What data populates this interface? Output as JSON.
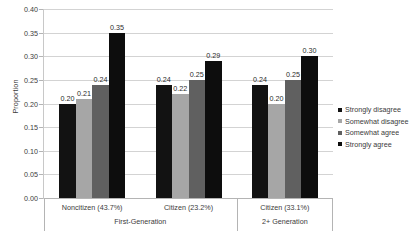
{
  "chart_data": {
    "type": "bar",
    "title": "",
    "xlabel": "",
    "ylabel": "Proportion",
    "ylim": [
      0,
      0.4
    ],
    "ytick_labels": [
      "0.00",
      "0.05",
      "0.10",
      "0.15",
      "0.20",
      "0.25",
      "0.30",
      "0.35",
      "0.40"
    ],
    "ytick_values": [
      0,
      0.05,
      0.1,
      0.15,
      0.2,
      0.25,
      0.3,
      0.35,
      0.4
    ],
    "grid": true,
    "legend_position": "right",
    "categories": [
      "Noncitizen (43.7%)",
      "Citizen (23.2%)",
      "Citizen (33.1%)"
    ],
    "supercategories": [
      {
        "label": "First-Generation",
        "categories": [
          "Noncitizen (43.7%)",
          "Citizen (23.2%)"
        ]
      },
      {
        "label": "2+ Generation",
        "categories": [
          "Citizen (33.1%)"
        ]
      }
    ],
    "series": [
      {
        "name": "Strongly disagree",
        "color": "#121212",
        "values": [
          0.2,
          0.24,
          0.24
        ],
        "labels": [
          "0.20",
          "0.24",
          "0.24"
        ]
      },
      {
        "name": "Somewhat disagree",
        "color": "#a6a6a6",
        "values": [
          0.21,
          0.22,
          0.2
        ],
        "labels": [
          "0.21",
          "0.22",
          "0.20"
        ]
      },
      {
        "name": "Somewhat agree",
        "color": "#606060",
        "values": [
          0.24,
          0.25,
          0.25
        ],
        "labels": [
          "0.24",
          "0.25",
          "0.25"
        ]
      },
      {
        "name": "Strongly agree",
        "color": "#0d0d0d",
        "values": [
          0.35,
          0.29,
          0.3
        ],
        "labels": [
          "0.35",
          "0.29",
          "0.30"
        ]
      }
    ]
  }
}
